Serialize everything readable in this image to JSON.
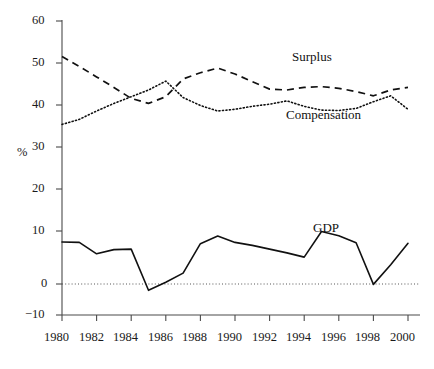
{
  "chart_data": {
    "type": "line",
    "title": "",
    "xlabel": "",
    "ylabel": "%",
    "xlim": [
      1980,
      2000
    ],
    "ylim": [
      -10,
      60
    ],
    "grid": false,
    "legend_position": "inline-annotations",
    "x": [
      1980,
      1981,
      1982,
      1983,
      1984,
      1985,
      1986,
      1987,
      1988,
      1989,
      1990,
      1991,
      1992,
      1993,
      1994,
      1995,
      1996,
      1997,
      1998,
      1999,
      2000
    ],
    "xticks": [
      "1980",
      "1982",
      "1984",
      "1986",
      "1988",
      "1990",
      "1992",
      "1994",
      "1996",
      "1998",
      "2000"
    ],
    "yticks": [
      "-10",
      "0",
      "10",
      "20",
      "30",
      "40",
      "50",
      "60"
    ],
    "series": [
      {
        "name": "Surplus",
        "style": "dashed",
        "values": [
          54.2,
          51.8,
          49.3,
          46.8,
          44.2,
          43.0,
          44.6,
          48.8,
          50.3,
          51.4,
          50.0,
          48.2,
          46.4,
          46.2,
          46.8,
          47.0,
          46.6,
          45.8,
          44.8,
          46.2,
          46.8
        ]
      },
      {
        "name": "Compensation",
        "style": "dotted",
        "values": [
          38.0,
          39.2,
          41.2,
          43.0,
          44.6,
          46.2,
          48.3,
          44.4,
          42.5,
          41.2,
          41.6,
          42.3,
          42.8,
          43.6,
          42.3,
          41.4,
          41.3,
          41.8,
          43.4,
          44.8,
          41.6
        ]
      },
      {
        "name": "GDP",
        "style": "solid",
        "values": [
          10.0,
          9.9,
          7.2,
          8.2,
          8.3,
          -1.5,
          0.4,
          2.6,
          9.6,
          11.4,
          9.9,
          9.2,
          8.3,
          7.4,
          6.4,
          12.5,
          11.5,
          9.8,
          7.7,
          7.5,
          8.3
        ]
      }
    ],
    "gdp_tail": {
      "note": "final segment dips to zero at 1998 then rises",
      "x": [
        1997,
        1998,
        1999,
        2000
      ],
      "values": [
        8.3,
        -0.1,
        4.6,
        9.7
      ]
    },
    "annotations": [
      {
        "name": "Surplus",
        "text": "Surplus",
        "x_px": 292,
        "y_px": 49
      },
      {
        "name": "Compensation",
        "text": "Compensation",
        "x_px": 286,
        "y_px": 107
      },
      {
        "name": "GDP",
        "text": "GDP",
        "x_px": 313,
        "y_px": 220
      }
    ],
    "geometry": {
      "x_of_1980_px": 62,
      "x_of_2000_px": 408,
      "y_of_0_px": 284,
      "px_per_10_units": 42
    }
  },
  "ylabels": {
    "t60": "60",
    "t50": "50",
    "t40": "40",
    "t30": "30",
    "t20": "20",
    "t10": "10",
    "t0": "0",
    "tm10": "−10"
  },
  "xlabels": {
    "x1980": "1980",
    "x1982": "1982",
    "x1984": "1984",
    "x1986": "1986",
    "x1988": "1988",
    "x1990": "1990",
    "x1992": "1992",
    "x1994": "1994",
    "x1996": "1996",
    "x1998": "1998",
    "x2000": "2000"
  },
  "axis": {
    "percent_symbol": "%"
  },
  "labels": {
    "surplus": "Surplus",
    "compensation": "Compensation",
    "gdp": "GDP"
  },
  "colors": {
    "ink": "#111111",
    "axis": "#4a4a4a",
    "background": "#ffffff"
  }
}
